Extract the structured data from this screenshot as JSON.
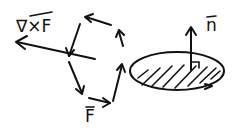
{
  "diagram": {
    "title": "",
    "labels": {
      "curl": "∇×F",
      "field": "F",
      "normal": "n"
    },
    "elements": [
      {
        "id": "curl-vector",
        "label": "∇×F",
        "type": "arrow"
      },
      {
        "id": "circulation-loop",
        "label": "F",
        "type": "hexagonal arrow loop"
      },
      {
        "id": "surface-disk",
        "type": "hatched ellipse with circulation arrow"
      },
      {
        "id": "normal-vector",
        "label": "n",
        "type": "arrow"
      }
    ],
    "colors": {
      "ink": "#111111",
      "background": "#ffffff"
    }
  }
}
